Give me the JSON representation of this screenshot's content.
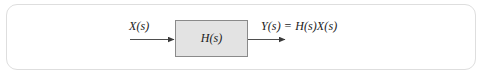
{
  "figure": {
    "type": "block-diagram",
    "background_color": "#ffffff",
    "card": {
      "border_color": "#dedede",
      "fill_color": "#ffffff",
      "corner_radius": "11"
    },
    "block": {
      "label": "H(s)",
      "fill_color": "#e3e3e3",
      "border_color": "#8a8a8a"
    },
    "input": {
      "label": "X(s)",
      "arrow_color": "#3a3a3a",
      "direction": "right"
    },
    "output": {
      "label": "Y(s) = H(s)X(s)",
      "arrow_color": "#3a3a3a",
      "direction": "right"
    }
  }
}
